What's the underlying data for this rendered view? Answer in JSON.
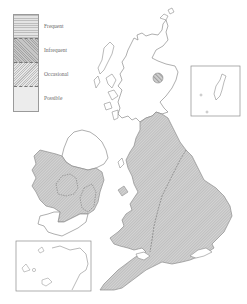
{
  "map": {
    "title": "",
    "legend": {
      "items": [
        {
          "label": "Frequent",
          "pattern": "horizontal-lines",
          "color": "#a8a8a8"
        },
        {
          "label": "Infrequent",
          "pattern": "cross-hatch",
          "color": "#b0b0b0"
        },
        {
          "label": "Occasional",
          "pattern": "diagonal-hatch",
          "color": "#b8b8b8"
        },
        {
          "label": "Possible",
          "pattern": "stipple",
          "color": "#d2d2d2"
        }
      ]
    },
    "regions": [
      {
        "name": "Scotland",
        "category": "none"
      },
      {
        "name": "North-east Scotland spot",
        "category": "Frequent"
      },
      {
        "name": "Northern Ireland",
        "category": "none"
      },
      {
        "name": "Ireland central/west",
        "category": "Occasional"
      },
      {
        "name": "Ireland central patches",
        "category": "Infrequent"
      },
      {
        "name": "Northern & Western England, Wales",
        "category": "Occasional"
      },
      {
        "name": "Eastern & Southern England",
        "category": "Occasional"
      },
      {
        "name": "South-west Ireland",
        "category": "none"
      }
    ],
    "insets": [
      {
        "name": "shetland-inset"
      },
      {
        "name": "channel-islands-inset"
      }
    ],
    "colors": {
      "outline": "#8c8c8c",
      "hatch": "#a0a0a0",
      "background": "#ffffff"
    }
  }
}
